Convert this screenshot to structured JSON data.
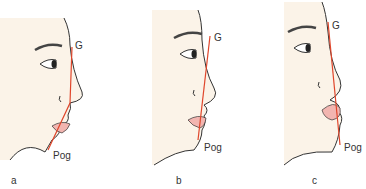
{
  "figure": {
    "panels": [
      {
        "caption": "a",
        "glabel": "G",
        "poglabel": "Pog"
      },
      {
        "caption": "b",
        "glabel": "G",
        "poglabel": "Pog"
      },
      {
        "caption": "c",
        "glabel": "G",
        "poglabel": "Pog"
      }
    ],
    "colors": {
      "skin": "#fbf3e8",
      "outline": "#333333",
      "line": "#e0452a",
      "lip": "#f2b5b0"
    }
  }
}
